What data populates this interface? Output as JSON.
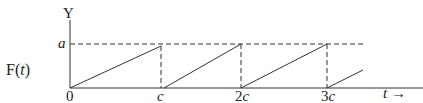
{
  "diagram": {
    "function_label": "F(t)",
    "y_axis_label": "Y",
    "x_axis_label": "t →",
    "level_label": "a",
    "x_ticks": [
      "0",
      "c",
      "2c",
      "3c"
    ]
  },
  "chart_data": {
    "type": "line",
    "title": "",
    "xlabel": "t",
    "ylabel": "Y",
    "function": "F(t)",
    "period": "c",
    "amplitude": "a",
    "x_tick_labels": [
      "0",
      "c",
      "2c",
      "3c"
    ],
    "y_tick_labels": [
      "a"
    ],
    "series": [
      {
        "name": "F(t)",
        "x": [
          0,
          1,
          1,
          2,
          2,
          3,
          3,
          3.42
        ],
        "y": [
          0,
          1,
          0,
          1,
          0,
          1,
          0,
          0.42
        ]
      }
    ],
    "units_note": "x in multiples of c, y in multiples of a",
    "grid": false
  }
}
